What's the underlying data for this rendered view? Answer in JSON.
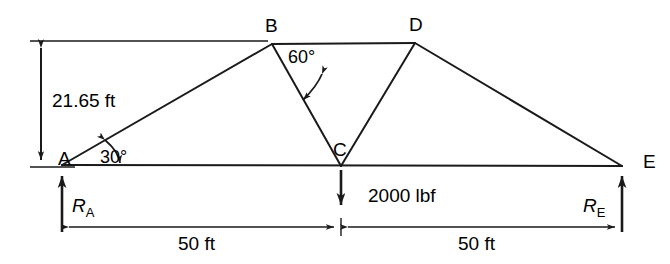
{
  "figure": {
    "nodes": [
      {
        "name": "A",
        "label": "A",
        "x": 62,
        "y": 165
      },
      {
        "name": "B",
        "label": "B",
        "x": 272,
        "y": 44
      },
      {
        "name": "C",
        "label": "C",
        "x": 341,
        "y": 166
      },
      {
        "name": "D",
        "label": "D",
        "x": 415,
        "y": 43
      },
      {
        "name": "E",
        "label": "E",
        "x": 622,
        "y": 166
      }
    ],
    "members": [
      {
        "from": "A",
        "to": "B"
      },
      {
        "from": "B",
        "to": "D"
      },
      {
        "from": "B",
        "to": "C"
      },
      {
        "from": "C",
        "to": "D"
      },
      {
        "from": "D",
        "to": "E"
      },
      {
        "from": "A",
        "to": "E"
      }
    ],
    "labels": {
      "node_a": "A",
      "node_b": "B",
      "node_c": "C",
      "node_d": "D",
      "node_e": "E"
    },
    "dimensions": {
      "height_label": "21.65 ft",
      "span_left_label": "50 ft",
      "span_right_label": "50 ft"
    },
    "angles": {
      "angle_at_a": "30°",
      "angle_at_b": "60°"
    },
    "loads": {
      "applied_load_label": "2000 lbf",
      "reaction_a_label": "R",
      "reaction_a_sub": "A",
      "reaction_e_label": "R",
      "reaction_e_sub": "E"
    },
    "colors": {
      "line": "#1a1a1a",
      "background": "#ffffff",
      "text": "#000000"
    }
  }
}
